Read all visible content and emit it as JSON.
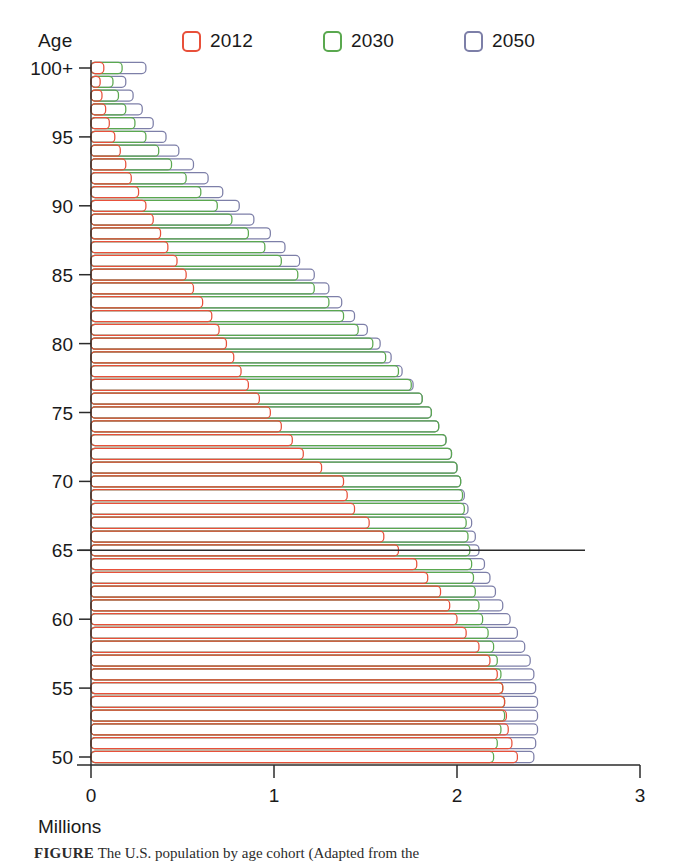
{
  "axis_label_y": "Age",
  "axis_label_x": "Millions",
  "caption_prefix": "FIGURE",
  "caption_text": "The U.S. population by age cohort (Adapted from the",
  "colors": {
    "series_2012": "#e8503a",
    "series_2030": "#5aa84f",
    "series_2050": "#7d7fa8",
    "axis": "#2b2b2b",
    "reference_line": "#2b2b2b",
    "background": "#ffffff"
  },
  "legend": {
    "items": [
      {
        "label": "2012",
        "color": "#e8503a",
        "key": "y2012"
      },
      {
        "label": "2030",
        "color": "#5aa84f",
        "key": "y2030"
      },
      {
        "label": "2050",
        "color": "#7d7fa8",
        "key": "y2050"
      }
    ]
  },
  "reference_line": {
    "age": 65,
    "label": "65"
  },
  "chart_data": {
    "type": "bar",
    "orientation": "horizontal",
    "title": "",
    "subtitle": "",
    "xlabel": "Millions",
    "ylabel": "Age",
    "xlim": [
      0,
      3
    ],
    "ylim": [
      50,
      100
    ],
    "xticks": [
      0,
      1,
      2,
      3
    ],
    "xticklabels": [
      "0",
      "1",
      "2",
      "3"
    ],
    "yticks": [
      50,
      55,
      60,
      65,
      70,
      75,
      80,
      85,
      90,
      95,
      100
    ],
    "yticklabels": [
      "50",
      "55",
      "60",
      "65",
      "70",
      "75",
      "80",
      "85",
      "90",
      "95",
      "100+"
    ],
    "grid": false,
    "legend_position": "top",
    "units": "millions of people",
    "annotations": [
      {
        "type": "hline",
        "value": 65,
        "note": "retirement age reference line"
      }
    ],
    "categories": [
      50,
      51,
      52,
      53,
      54,
      55,
      56,
      57,
      58,
      59,
      60,
      61,
      62,
      63,
      64,
      65,
      66,
      67,
      68,
      69,
      70,
      71,
      72,
      73,
      74,
      75,
      76,
      77,
      78,
      79,
      80,
      81,
      82,
      83,
      84,
      85,
      86,
      87,
      88,
      89,
      90,
      91,
      92,
      93,
      94,
      95,
      96,
      97,
      98,
      99,
      100
    ],
    "series": [
      {
        "name": "2012",
        "color": "#e8503a",
        "values": [
          2.33,
          2.3,
          2.28,
          2.27,
          2.26,
          2.25,
          2.22,
          2.18,
          2.12,
          2.05,
          2.0,
          1.96,
          1.91,
          1.84,
          1.78,
          1.68,
          1.6,
          1.52,
          1.44,
          1.4,
          1.38,
          1.26,
          1.16,
          1.1,
          1.04,
          0.98,
          0.92,
          0.86,
          0.82,
          0.78,
          0.74,
          0.7,
          0.66,
          0.61,
          0.56,
          0.52,
          0.47,
          0.42,
          0.38,
          0.34,
          0.3,
          0.26,
          0.22,
          0.19,
          0.16,
          0.13,
          0.1,
          0.08,
          0.06,
          0.05,
          0.07
        ]
      },
      {
        "name": "2030",
        "color": "#5aa84f",
        "values": [
          2.2,
          2.22,
          2.24,
          2.26,
          2.26,
          2.25,
          2.24,
          2.22,
          2.2,
          2.17,
          2.14,
          2.12,
          2.1,
          2.09,
          2.08,
          2.07,
          2.06,
          2.05,
          2.04,
          2.03,
          2.02,
          2.0,
          1.97,
          1.94,
          1.9,
          1.86,
          1.81,
          1.75,
          1.68,
          1.61,
          1.54,
          1.46,
          1.38,
          1.3,
          1.22,
          1.13,
          1.04,
          0.95,
          0.86,
          0.77,
          0.69,
          0.6,
          0.52,
          0.44,
          0.37,
          0.3,
          0.24,
          0.19,
          0.15,
          0.12,
          0.17
        ]
      },
      {
        "name": "2050",
        "color": "#7d7fa8",
        "values": [
          2.42,
          2.43,
          2.44,
          2.44,
          2.44,
          2.43,
          2.42,
          2.4,
          2.37,
          2.33,
          2.29,
          2.25,
          2.21,
          2.18,
          2.15,
          2.12,
          2.1,
          2.08,
          2.06,
          2.04,
          2.02,
          2.0,
          1.97,
          1.94,
          1.9,
          1.86,
          1.81,
          1.76,
          1.7,
          1.64,
          1.58,
          1.51,
          1.44,
          1.37,
          1.3,
          1.22,
          1.14,
          1.06,
          0.98,
          0.89,
          0.81,
          0.72,
          0.64,
          0.56,
          0.48,
          0.41,
          0.34,
          0.28,
          0.23,
          0.19,
          0.3
        ]
      }
    ]
  }
}
